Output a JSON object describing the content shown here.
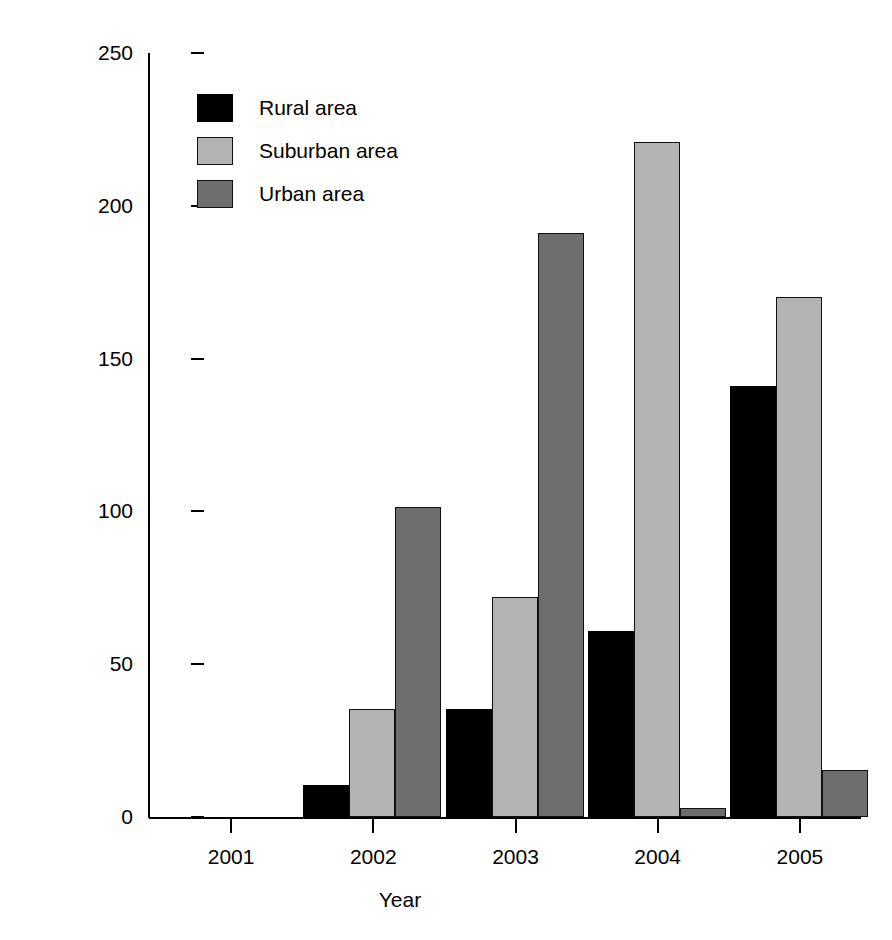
{
  "chart_data": {
    "type": "bar",
    "title": "",
    "subtitle": "",
    "xlabel": "Year",
    "ylabel": "Plant biomass (g m-2)",
    "ylabel_html": "Plant biomass (g m<sup>&#8722;2</sup>)",
    "categories": [
      "2001",
      "2002",
      "2003",
      "2004",
      "2005"
    ],
    "series": [
      {
        "name": "Rural area",
        "color": "#000000",
        "values": [
          0,
          10.5,
          35.5,
          61,
          141
        ]
      },
      {
        "name": "Suburban area",
        "color": "#b3b3b3",
        "values": [
          0,
          35.5,
          72,
          221,
          170
        ]
      },
      {
        "name": "Urban area",
        "color": "#6e6e6e",
        "values": [
          0,
          101.5,
          191,
          3,
          15.5
        ]
      }
    ],
    "ylim": [
      0,
      250
    ],
    "yticks": [
      0,
      50,
      100,
      150,
      200,
      250
    ],
    "ytick_labels": [
      "0",
      "50",
      "100",
      "150",
      "200",
      "250"
    ],
    "xtick_labels": [
      "2001",
      "2002",
      "2003",
      "2004",
      "2005"
    ],
    "grid": false,
    "legend_position": "top-left",
    "legend_entries": [
      "Rural area",
      "Suburban area",
      "Urban area"
    ]
  }
}
